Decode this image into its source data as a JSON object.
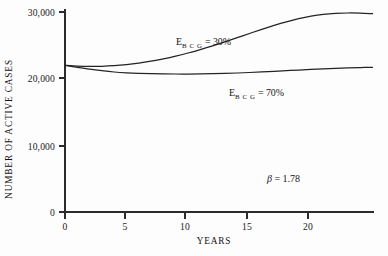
{
  "chart_data": {
    "type": "line",
    "title": "",
    "xlabel": "YEARS",
    "ylabel": "NUMBER OF ACTIVE CASES",
    "xlim": [
      0,
      25
    ],
    "ylim": [
      0,
      30000
    ],
    "grid": false,
    "legend_position": "inline-annotations",
    "xticks": [
      0,
      5,
      10,
      15,
      20
    ],
    "xticklabels": [
      "0",
      "5",
      "10",
      "15",
      "20"
    ],
    "yticks": [
      0,
      10000,
      20000,
      30000
    ],
    "yticklabels": [
      "0",
      "10,000",
      "20,000",
      "30,000"
    ],
    "series": [
      {
        "name": "E_BCG = 30%",
        "label_main": "E",
        "label_sub": "B C G",
        "label_rest": " = 30%",
        "x": [
          0,
          1,
          2,
          3,
          4,
          5,
          6,
          7,
          8,
          9,
          10,
          11,
          12,
          13,
          14,
          15,
          16,
          17,
          18,
          19,
          20,
          21,
          22,
          23,
          24,
          25
        ],
        "values": [
          22000,
          21880,
          21830,
          21850,
          21940,
          22100,
          22330,
          22620,
          22970,
          23380,
          23850,
          24370,
          24930,
          25530,
          26150,
          26780,
          27400,
          27990,
          28530,
          29000,
          29380,
          29650,
          29800,
          29850,
          29830,
          29750
        ]
      },
      {
        "name": "E_BCG = 70%",
        "label_main": "E",
        "label_sub": "B C G",
        "label_rest": " = 70%",
        "x": [
          0,
          1,
          2,
          3,
          4,
          5,
          6,
          7,
          8,
          9,
          10,
          11,
          12,
          13,
          14,
          15,
          16,
          17,
          18,
          19,
          20,
          21,
          22,
          23,
          24,
          25
        ],
        "values": [
          22000,
          21700,
          21420,
          21190,
          21000,
          20870,
          20790,
          20740,
          20710,
          20700,
          20700,
          20715,
          20745,
          20790,
          20850,
          20925,
          21010,
          21100,
          21195,
          21290,
          21380,
          21465,
          21540,
          21605,
          21660,
          21700
        ]
      }
    ],
    "annotations": [
      {
        "name": "beta-annotation",
        "beta_symbol": "β",
        "rest": " = 1.78",
        "x": 18.5,
        "y": 6200
      }
    ]
  },
  "labels": {
    "curve_upper": {
      "main": "E",
      "sub": "B C G",
      "rest": "= 30%"
    },
    "curve_lower": {
      "main": "E",
      "sub": "B C G",
      "rest": "= 70%"
    },
    "beta": {
      "symbol": "β",
      "rest": "= 1.78"
    }
  },
  "axes": {
    "x_title": "YEARS",
    "y_title": "NUMBER OF ACTIVE CASES",
    "x_ticks": [
      "0",
      "5",
      "10",
      "15",
      "20"
    ],
    "y_ticks": [
      "30,000",
      "20,000",
      "10,000",
      "0"
    ]
  },
  "colors": {
    "background": "#fdfdfd",
    "axis": "#2b2b2b",
    "curve": "#232323",
    "text": "#1a1a1a"
  }
}
